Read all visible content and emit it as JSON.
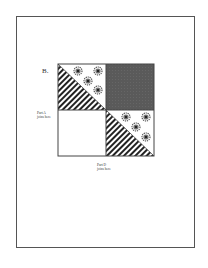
{
  "diagram": {
    "label": "B.",
    "part_a": {
      "line1": "Part A",
      "line2": "joins here"
    },
    "part_d": {
      "line1": "Part D",
      "line2": "joins here"
    },
    "colors": {
      "border": "#444444",
      "dark": "#5a5a5a",
      "hatch": "#222222",
      "flower": "#555555"
    }
  }
}
